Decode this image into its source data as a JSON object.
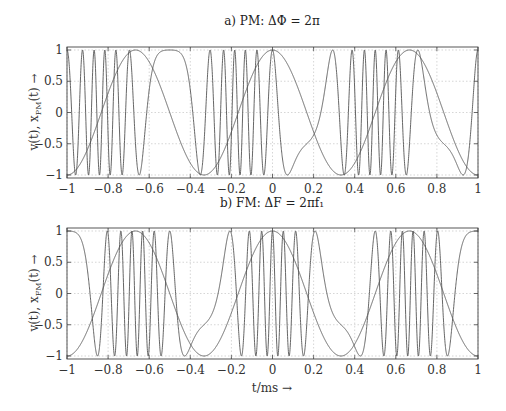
{
  "figure": {
    "xlabel": "t/ms →",
    "panels": [
      {
        "title": "a) PM: ΔΦ = 2π",
        "ylabel": "v(t), x_PM(t) →",
        "ylabel_main": "v(t), x",
        "ylabel_sub": "PM",
        "ylabel_tail": "(t) →"
      },
      {
        "title": "b) FM: ΔF = 2πf₁",
        "ylabel": "v(t), x_FM(t) →",
        "ylabel_main": "v(t), x",
        "ylabel_sub": "FM",
        "ylabel_tail": "(t) →"
      }
    ],
    "xticks": [
      "−1",
      "−0.8",
      "−0.6",
      "−0.4",
      "−0.2",
      "0",
      "0.2",
      "0.4",
      "0.6",
      "0.8",
      "1"
    ],
    "yticks": [
      "−1",
      "−0.5",
      "0",
      "0.5",
      "1"
    ]
  },
  "chart_data": [
    {
      "type": "line",
      "title": "a) PM: ΔΦ = 2π",
      "xlabel": "t/ms",
      "ylabel": "v(t), x_PM(t)",
      "xlim": [
        -1,
        1
      ],
      "ylim": [
        -1,
        1
      ],
      "grid": true,
      "xticks": [
        -1,
        -0.8,
        -0.6,
        -0.4,
        -0.2,
        0,
        0.2,
        0.4,
        0.6,
        0.8,
        1
      ],
      "yticks": [
        -1,
        -0.5,
        0,
        0.5,
        1
      ],
      "series": [
        {
          "name": "v(t) modulating signal",
          "formula": "cos(2π·f1·t)",
          "f1_kHz": 1.5
        },
        {
          "name": "x_PM(t)",
          "formula": "cos(2π·fc·t + ΔΦ·v(t))",
          "fc_kHz": 10,
          "delta_phi": 6.2832
        }
      ],
      "colors": {
        "line": "#555555",
        "grid": "#bbbbbb",
        "frame": "#444444"
      }
    },
    {
      "type": "line",
      "title": "b) FM: ΔF = 2πf₁",
      "xlabel": "t/ms",
      "ylabel": "v(t), x_FM(t)",
      "xlim": [
        -1,
        1
      ],
      "ylim": [
        -1,
        1
      ],
      "grid": true,
      "xticks": [
        -1,
        -0.8,
        -0.6,
        -0.4,
        -0.2,
        0,
        0.2,
        0.4,
        0.6,
        0.8,
        1
      ],
      "yticks": [
        -1,
        -0.5,
        0,
        0.5,
        1
      ],
      "series": [
        {
          "name": "v(t) modulating signal",
          "formula": "cos(2π·f1·t)",
          "f1_kHz": 1.5
        },
        {
          "name": "x_FM(t)",
          "formula": "cos(2π·fc·t + (ΔF/(2π·f1))·sin(2π·f1·t))",
          "fc_kHz": 10,
          "modulation_index": 6.2832
        }
      ],
      "colors": {
        "line": "#555555",
        "grid": "#bbbbbb",
        "frame": "#444444"
      }
    }
  ]
}
